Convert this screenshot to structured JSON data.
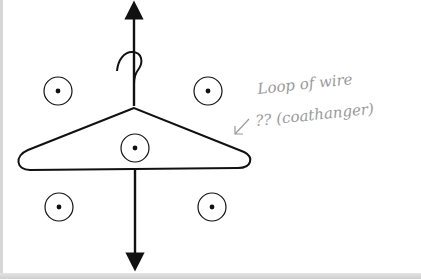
{
  "diagram": {
    "annotation": {
      "line1": "Loop of wire",
      "line2": "?? (coathanger)"
    },
    "colors": {
      "ink": "#111111",
      "pencil": "#9a9a9a",
      "paper": "#ffffff"
    },
    "field_points": [
      {
        "x": 58,
        "y": 91
      },
      {
        "x": 208,
        "y": 91
      },
      {
        "x": 135,
        "y": 148
      },
      {
        "x": 59,
        "y": 207
      },
      {
        "x": 212,
        "y": 207
      }
    ],
    "symbol": "field-out-of-page",
    "arrows": {
      "up": "current-up-arrow",
      "down": "current-down-arrow"
    }
  }
}
